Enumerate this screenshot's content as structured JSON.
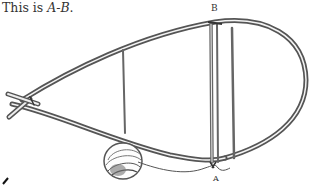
{
  "caption": {
    "prefix": "This is ",
    "term": "A-B",
    "suffix": "."
  },
  "labels": {
    "top": "B",
    "bottom": "A"
  },
  "figure": {
    "stroke_color": "#555555",
    "fill_color": "#ffffff"
  }
}
